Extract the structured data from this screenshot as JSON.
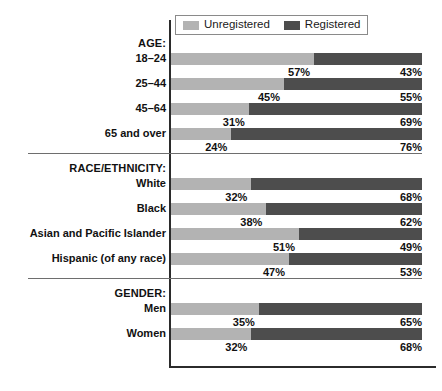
{
  "legend": {
    "items": [
      {
        "label": "Unregistered",
        "color": "#b3b3b3",
        "key": "unregistered"
      },
      {
        "label": "Registered",
        "color": "#4d4d4d",
        "key": "registered"
      }
    ]
  },
  "sections": [
    {
      "header": "AGE:",
      "rows": [
        {
          "label": "18–24",
          "unregistered": 57,
          "registered": 43,
          "left_label": "57%",
          "right_label": "43%"
        },
        {
          "label": "25–44",
          "unregistered": 45,
          "registered": 55,
          "left_label": "45%",
          "right_label": "55%"
        },
        {
          "label": "45–64",
          "unregistered": 31,
          "registered": 69,
          "left_label": "31%",
          "right_label": "69%"
        },
        {
          "label": "65 and over",
          "unregistered": 24,
          "registered": 76,
          "left_label": "24%",
          "right_label": "76%"
        }
      ]
    },
    {
      "header": "RACE/ETHNICITY:",
      "rows": [
        {
          "label": "White",
          "unregistered": 32,
          "registered": 68,
          "left_label": "32%",
          "right_label": "68%"
        },
        {
          "label": "Black",
          "unregistered": 38,
          "registered": 62,
          "left_label": "38%",
          "right_label": "62%"
        },
        {
          "label": "Asian and Pacific Islander",
          "unregistered": 51,
          "registered": 49,
          "left_label": "51%",
          "right_label": "49%"
        },
        {
          "label": "Hispanic (of any race)",
          "unregistered": 47,
          "registered": 53,
          "left_label": "47%",
          "right_label": "53%"
        }
      ]
    },
    {
      "header": "GENDER:",
      "rows": [
        {
          "label": "Men",
          "unregistered": 35,
          "registered": 65,
          "left_label": "35%",
          "right_label": "65%"
        },
        {
          "label": "Women",
          "unregistered": 32,
          "registered": 68,
          "left_label": "32%",
          "right_label": "68%"
        }
      ]
    }
  ],
  "chart_data": {
    "type": "bar",
    "title": "",
    "subtitle": "",
    "xlabel": "",
    "ylabel": "",
    "orientation": "horizontal",
    "stacked": true,
    "normalized": true,
    "xlim": [
      0,
      100
    ],
    "grid": false,
    "legend_position": "top",
    "legend_entries": [
      "Unregistered",
      "Registered"
    ],
    "value_suffix": "%",
    "group_labels": [
      "AGE:",
      "RACE/ETHNICITY:",
      "GENDER:"
    ],
    "categories": [
      "18–24",
      "25–44",
      "45–64",
      "65 and over",
      "White",
      "Black",
      "Asian and Pacific Islander",
      "Hispanic (of any race)",
      "Men",
      "Women"
    ],
    "series": [
      {
        "name": "Unregistered",
        "color": "#b3b3b3",
        "values": [
          57,
          45,
          31,
          24,
          32,
          38,
          51,
          47,
          35,
          32
        ]
      },
      {
        "name": "Registered",
        "color": "#4d4d4d",
        "values": [
          43,
          55,
          69,
          76,
          68,
          62,
          49,
          53,
          65,
          68
        ]
      }
    ],
    "groups": [
      {
        "name": "AGE:",
        "categories": [
          "18–24",
          "25–44",
          "45–64",
          "65 and over"
        ],
        "unregistered": [
          57,
          45,
          31,
          24
        ],
        "registered": [
          43,
          55,
          69,
          76
        ]
      },
      {
        "name": "RACE/ETHNICITY:",
        "categories": [
          "White",
          "Black",
          "Asian and Pacific Islander",
          "Hispanic (of any race)"
        ],
        "unregistered": [
          32,
          38,
          51,
          47
        ],
        "registered": [
          68,
          62,
          49,
          53
        ]
      },
      {
        "name": "GENDER:",
        "categories": [
          "Men",
          "Women"
        ],
        "unregistered": [
          35,
          32
        ],
        "registered": [
          65,
          68
        ]
      }
    ]
  }
}
